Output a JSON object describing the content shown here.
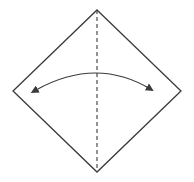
{
  "diagram": {
    "type": "origami-step",
    "colors": {
      "background": "#ffffff",
      "stroke": "#3a3a3a",
      "fold_line": "#3a3a3a"
    },
    "square": {
      "top": [
        97,
        10
      ],
      "right": [
        181,
        91
      ],
      "bottom": [
        97,
        172
      ],
      "left": [
        13,
        91
      ]
    },
    "fold_line": {
      "style": "dashed",
      "from": [
        97,
        10
      ],
      "to": [
        97,
        172
      ]
    },
    "arrow": {
      "style": "two-way curved",
      "start": [
        36,
        90
      ],
      "control": [
        97,
        56
      ],
      "end": [
        152,
        90
      ]
    }
  }
}
